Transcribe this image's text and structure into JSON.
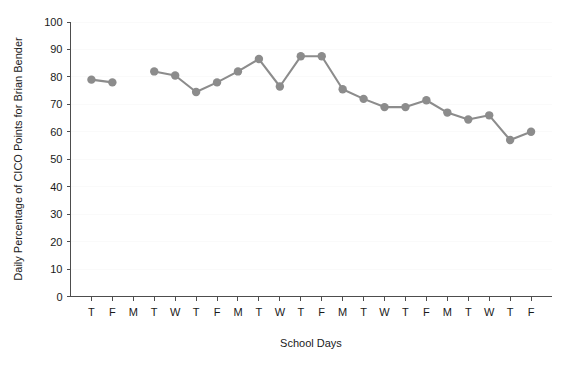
{
  "chart_data": {
    "type": "line",
    "title": "",
    "xlabel": "School Days",
    "ylabel": "Daily Percentage of CICO Points for Brian Bender",
    "ylim": [
      0,
      100
    ],
    "ytick_labels": [
      "0",
      "10",
      "20",
      "30",
      "40",
      "50",
      "60",
      "70",
      "80",
      "90",
      "100"
    ],
    "yticks": [
      0,
      10,
      20,
      30,
      40,
      50,
      60,
      70,
      80,
      90,
      100
    ],
    "categories": [
      "T",
      "F",
      "M",
      "T",
      "W",
      "T",
      "F",
      "M",
      "T",
      "W",
      "T",
      "F",
      "M",
      "T",
      "W",
      "T",
      "F",
      "M",
      "T",
      "W",
      "T",
      "F"
    ],
    "values": [
      79,
      78,
      null,
      82,
      80.5,
      74.5,
      78,
      82,
      86.5,
      76.5,
      87.5,
      87.5,
      75.5,
      72,
      69,
      69,
      71.5,
      67,
      64.5,
      66,
      57,
      60
    ],
    "grid": false,
    "legend": "none",
    "series_color": "#8c8c8c",
    "marker": "circle",
    "marker_size": 4.2,
    "break_in_line": {
      "after_index": 1,
      "note": "no data point plotted at third school day (M)"
    },
    "axis_color": "#4d4d4d",
    "text_color": "#1a1a1a",
    "background": "#ffffff"
  },
  "figure": {
    "name": "daily-cico-points-line-chart"
  }
}
